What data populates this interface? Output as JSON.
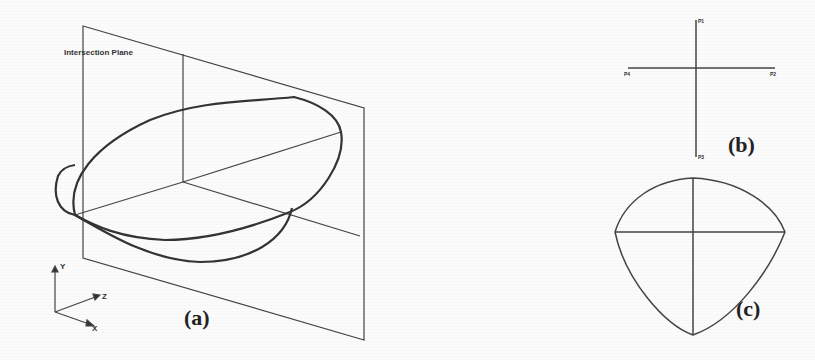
{
  "panels": {
    "a": {
      "label": "(a)",
      "plane_label": "Intersection Plane",
      "axes": {
        "y": "Y",
        "z": "Z",
        "x": "X"
      }
    },
    "b": {
      "label": "(b)",
      "points": {
        "top": "P1",
        "left": "P4",
        "right": "P2",
        "bottom": "P3"
      }
    },
    "c": {
      "label": "(c)"
    }
  },
  "colors": {
    "stroke": "#333333",
    "background": "#fbfbfb"
  }
}
